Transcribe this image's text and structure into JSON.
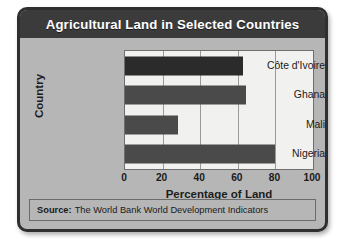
{
  "figure": {
    "title": "Agricultural Land in Selected Countries",
    "source_label": "Source:",
    "source_text": "The World Bank World Development Indicators",
    "colors": {
      "title_bar": "#3b3b3b",
      "title_text": "#ffffff",
      "body_background": "#b6b6b6",
      "plot_background": "#f1f1ef",
      "bar_default": "#4a4a4a",
      "bar_highlight": "#2b2b2b",
      "gridline": "#9a9a9a",
      "frame": "#2f2f2f"
    }
  },
  "chart_data": {
    "type": "bar",
    "orientation": "horizontal",
    "title": "Agricultural Land in Selected Countries",
    "xlabel": "Percentage of Land",
    "ylabel": "Country",
    "categories": [
      "Côte d'Ivoire",
      "Ghana",
      "Mali",
      "Nigeria"
    ],
    "values": [
      63,
      64.5,
      28,
      80
    ],
    "bar_colors": [
      "#2b2b2b",
      "#4a4a4a",
      "#4a4a4a",
      "#4a4a4a"
    ],
    "xlim": [
      0,
      100
    ],
    "xticks": [
      0,
      20,
      40,
      60,
      80,
      100
    ],
    "xtick_labels": [
      "0",
      "20",
      "40",
      "60",
      "80",
      "100"
    ],
    "grid": "vertical",
    "legend": null,
    "source": "Source: The World Bank World Development Indicators"
  }
}
